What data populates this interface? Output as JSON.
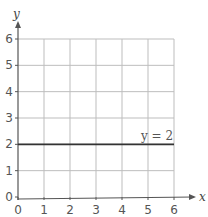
{
  "chart_data": {
    "type": "line",
    "title": "",
    "xlabel": "x",
    "ylabel": "y",
    "xlim": [
      0,
      6
    ],
    "ylim": [
      0,
      6
    ],
    "grid": true,
    "x_ticks": [
      "0",
      "1",
      "2",
      "3",
      "4",
      "5",
      "6"
    ],
    "y_ticks": [
      "0",
      "1",
      "2",
      "3",
      "4",
      "5",
      "6"
    ],
    "series": [
      {
        "name": "y = 2",
        "x": [
          0,
          6
        ],
        "y": [
          2,
          2
        ],
        "color": "#333333"
      }
    ],
    "annotations": [
      {
        "text": "y = 2",
        "x": 5,
        "y": 2.2
      }
    ]
  },
  "colors": {
    "grid": "#bdbdbd",
    "axis": "#555555",
    "line": "#333333"
  }
}
